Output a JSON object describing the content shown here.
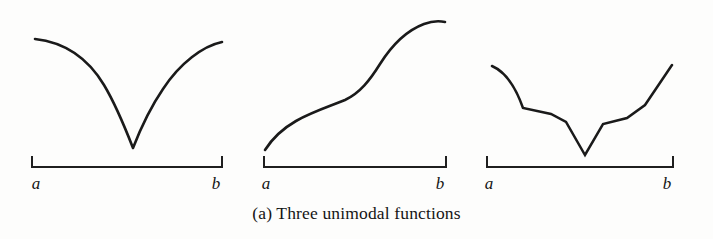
{
  "figure": {
    "caption": "(a) Three unimodal functions",
    "caption_label": "(a)",
    "background_color": "#fdfdfc",
    "ink_color": "#1a1a1a",
    "axis_color": "#1f1f1f",
    "width": 713,
    "height": 239
  },
  "panels": [
    {
      "id": "panel-1",
      "name": "smooth-v-shaped-unimodal",
      "curve_type": "smooth-cusp",
      "axis": {
        "left_label": "a",
        "right_label": "b",
        "x_start": 32,
        "x_end": 222,
        "baseline_y": 167,
        "tick_height": 11
      },
      "label_positions": {
        "left_label_x": 36,
        "right_label_x": 216,
        "label_y": 189
      },
      "path": "M 35,39 C 62,42 86,55 104,85 C 116,105 126,130 133,148 C 140,130 150,108 163,89 C 180,63 203,46 222,42",
      "minimum_point": [
        133,
        148
      ],
      "left_endpoint": [
        35,
        39
      ],
      "right_endpoint": [
        222,
        42
      ]
    },
    {
      "id": "panel-2",
      "name": "monotone-increasing-sigmoid",
      "curve_type": "sigmoid",
      "axis": {
        "left_label": "a",
        "right_label": "b",
        "x_start": 264,
        "x_end": 446,
        "baseline_y": 167,
        "tick_height": 11
      },
      "label_positions": {
        "left_label_x": 266,
        "right_label_x": 440,
        "label_y": 189
      },
      "path": "M 265,150 C 272,139 282,129 296,121 C 314,111 331,106 345,100 C 360,93 370,80 380,64 C 392,45 408,30 424,24 C 432,21 440,21 445,22",
      "minimum_point": [
        265,
        150
      ],
      "left_endpoint": [
        265,
        150
      ],
      "right_endpoint": [
        445,
        22
      ]
    },
    {
      "id": "panel-3",
      "name": "piecewise-linear-unimodal",
      "curve_type": "piecewise-linear",
      "axis": {
        "left_label": "a",
        "right_label": "b",
        "x_start": 487,
        "x_end": 673,
        "baseline_y": 167,
        "tick_height": 11
      },
      "label_positions": {
        "left_label_x": 489,
        "right_label_x": 667,
        "label_y": 189
      },
      "path": "M 492,66 C 506,72 516,88 523,108 L 551,114 L 566,122 L 585,155 L 603,124 L 627,118 L 645,105 L 672,65",
      "vertices": [
        [
          492,
          66
        ],
        [
          523,
          108
        ],
        [
          551,
          114
        ],
        [
          566,
          122
        ],
        [
          585,
          155
        ],
        [
          603,
          124
        ],
        [
          627,
          118
        ],
        [
          645,
          105
        ],
        [
          672,
          65
        ]
      ],
      "minimum_point": [
        585,
        155
      ],
      "left_endpoint": [
        492,
        66
      ],
      "right_endpoint": [
        672,
        65
      ]
    }
  ]
}
